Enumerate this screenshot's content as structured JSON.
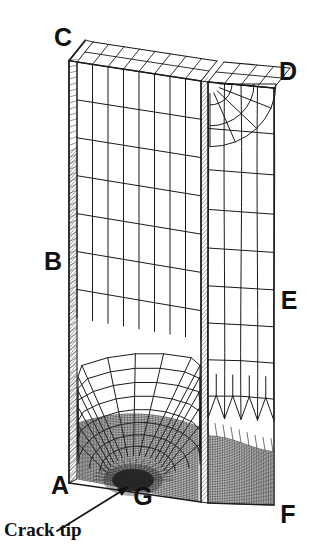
{
  "figure": {
    "kind": "3d-finite-element-mesh",
    "background_color": "#ffffff",
    "line_color": "#1a1a1a",
    "dense_zone_color": "#2b2b2b"
  },
  "labels": {
    "vertices": [
      {
        "id": "C",
        "text": "C",
        "x": 63,
        "y": 46,
        "anchor": "middle"
      },
      {
        "id": "D",
        "text": "D",
        "x": 288,
        "y": 80,
        "anchor": "middle"
      },
      {
        "id": "B",
        "text": "B",
        "x": 53,
        "y": 270,
        "anchor": "middle"
      },
      {
        "id": "E",
        "text": "E",
        "x": 289,
        "y": 309,
        "anchor": "middle"
      },
      {
        "id": "A",
        "text": "A",
        "x": 60,
        "y": 494,
        "anchor": "middle"
      },
      {
        "id": "F",
        "text": "F",
        "x": 288,
        "y": 523,
        "anchor": "middle"
      },
      {
        "id": "G",
        "text": "G",
        "x": 143,
        "y": 505,
        "anchor": "middle"
      }
    ],
    "annotation": {
      "id": "crack-tip",
      "text": "Crack tip",
      "x": 4,
      "y": 536,
      "leader": {
        "x1": 57,
        "y1": 531,
        "x2": 128,
        "y2": 487
      }
    }
  },
  "geometry": {
    "front_face": {
      "top_left": {
        "x": 77,
        "y": 62
      },
      "top_right": {
        "x": 201,
        "y": 81
      },
      "bottom_right": {
        "x": 201,
        "y": 502
      },
      "bottom_left": {
        "x": 77,
        "y": 479
      },
      "cols": 8,
      "rows": 11
    },
    "side_face": {
      "top_left": {
        "x": 208,
        "y": 82
      },
      "top_right": {
        "x": 274,
        "y": 88
      },
      "bottom_right": {
        "x": 274,
        "y": 505
      },
      "bottom_left": {
        "x": 208,
        "y": 503
      },
      "cols": 4,
      "rows": 11
    },
    "left_strip": {
      "x_offset": -8,
      "width": 8
    },
    "mid_strip": {
      "x": 201,
      "width": 7
    },
    "crack_tip": {
      "x": 133,
      "y": 482
    },
    "dense_zone": {
      "y_top": 418,
      "y_bottom": 500
    },
    "fan_zone": {
      "y_top": 318,
      "y_bottom": 420,
      "rings": 8,
      "spokes": 15
    }
  }
}
